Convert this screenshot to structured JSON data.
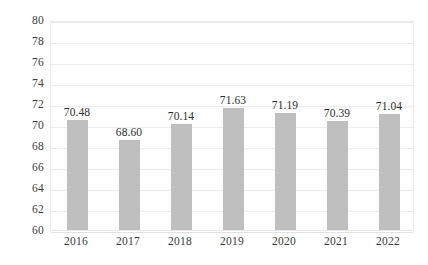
{
  "chart_data": {
    "type": "bar",
    "title": "",
    "subtitle": "",
    "xlabel": "",
    "ylabel": "",
    "categories": [
      "2016",
      "2017",
      "2018",
      "2019",
      "2020",
      "2021",
      "2022"
    ],
    "values": [
      70.48,
      68.6,
      70.14,
      71.63,
      71.19,
      70.39,
      71.04
    ],
    "data_labels": [
      "70.48",
      "68.60",
      "70.14",
      "71.63",
      "71.19",
      "70.39",
      "71.04"
    ],
    "ylim": [
      60,
      80
    ],
    "ytick_step": 2,
    "ytick_labels": [
      "80",
      "78",
      "76",
      "74",
      "72",
      "70",
      "68",
      "66",
      "64",
      "62",
      "60"
    ],
    "ytick_values": [
      80,
      78,
      76,
      74,
      72,
      70,
      68,
      66,
      64,
      62,
      60
    ],
    "grid": true,
    "grid_axis": "y",
    "legend": false,
    "legend_position": "none",
    "bar_color": "#bfbfbf",
    "grid_color": "#ececec",
    "plot_border_color": "#e8e8e8",
    "text_color": "#3b3b3b",
    "background_color": "#ffffff"
  }
}
